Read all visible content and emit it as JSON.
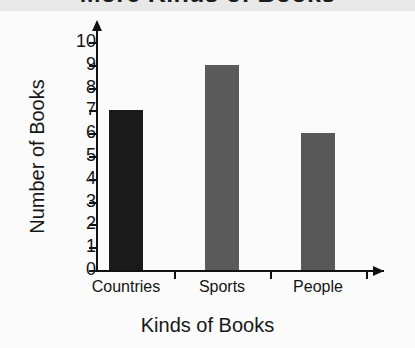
{
  "chart_data": {
    "type": "bar",
    "title": "More Kinds of Books",
    "xlabel": "Kinds of Books",
    "ylabel": "Number of Books",
    "categories": [
      "Countries",
      "Sports",
      "People"
    ],
    "values": [
      7,
      9,
      6
    ],
    "ylim": [
      0,
      10
    ],
    "ytick_labels": [
      "0",
      "1",
      "2",
      "3",
      "4",
      "5",
      "6",
      "7",
      "8",
      "9",
      "10"
    ],
    "grid": false,
    "legend": false,
    "bar_colors": [
      "#1a1a1a",
      "#5a5a5a",
      "#585858"
    ],
    "axis_color": "#121212",
    "background": "#fbfbfb",
    "title_band_color": "#e8e8e8"
  }
}
